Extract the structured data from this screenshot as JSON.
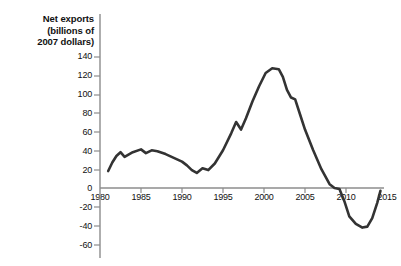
{
  "chart_data": {
    "type": "line",
    "title": "Net exports (billions of 2007 dollars)",
    "title_lines": [
      "Net exports",
      "(billions of",
      "2007 dollars)"
    ],
    "xlabel": "",
    "ylabel": "Net exports (billions of 2007 dollars)",
    "xlim": [
      1980,
      2015
    ],
    "ylim": [
      -60,
      140
    ],
    "grid": false,
    "legend": false,
    "legend_position": "none",
    "yticks": [
      140,
      120,
      100,
      80,
      60,
      40,
      20,
      0,
      -20,
      -40,
      -60
    ],
    "ytick_labels": [
      "140",
      "120",
      "100",
      "80",
      "60",
      "40",
      "20",
      "0",
      "-20",
      "-40",
      "-60"
    ],
    "xticks": [
      1980,
      1985,
      1990,
      1995,
      2000,
      2005,
      2010,
      2015
    ],
    "xtick_labels": [
      "1980",
      "1985",
      "1990",
      "1995",
      "2000",
      "2005",
      "2010",
      "2015"
    ],
    "line_color": "#333333",
    "axis_color": "#8c8c8c",
    "series": [
      {
        "name": "Net exports",
        "x": [
          1981.0,
          1981.5,
          1982.0,
          1982.5,
          1983.0,
          1984.0,
          1985.0,
          1985.6,
          1986.3,
          1987.0,
          1988.0,
          1989.0,
          1990.0,
          1990.6,
          1991.2,
          1991.8,
          1992.5,
          1993.2,
          1994.0,
          1995.0,
          1996.0,
          1996.6,
          1997.2,
          1997.8,
          1998.6,
          1999.4,
          2000.2,
          2001.0,
          2001.8,
          2002.3,
          2002.8,
          2003.3,
          2003.8,
          2004.4,
          2005.0,
          2006.0,
          2007.0,
          2008.0,
          2008.6,
          2009.2,
          2009.8,
          2010.4,
          2011.2,
          2012.0,
          2012.6,
          2013.2,
          2013.8,
          2014.2
        ],
        "y": [
          18,
          27,
          34,
          38,
          33,
          38,
          41,
          37,
          40,
          39,
          36,
          32,
          28,
          24,
          19,
          16,
          21,
          19,
          26,
          40,
          58,
          70,
          62,
          74,
          92,
          108,
          122,
          127,
          126,
          118,
          104,
          96,
          94,
          78,
          62,
          40,
          20,
          4,
          0,
          -1,
          -14,
          -30,
          -38,
          -42,
          -41,
          -32,
          -16,
          -3
        ]
      }
    ]
  }
}
